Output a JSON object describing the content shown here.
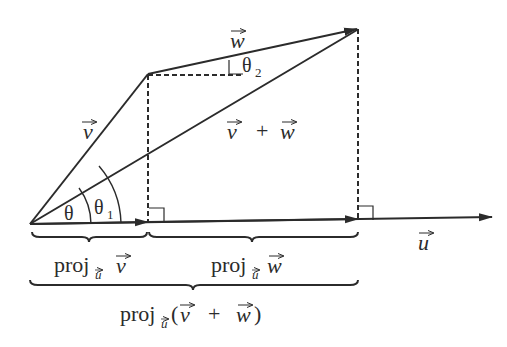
{
  "diagram": {
    "type": "vector-projection-diagram",
    "colors": {
      "stroke": "#2b2b2b",
      "background": "#ffffff"
    },
    "points": {
      "origin": [
        30,
        224
      ],
      "v_tip": [
        148,
        74
      ],
      "vw_tip": [
        357,
        29
      ],
      "v_foot": [
        148,
        222
      ],
      "vw_foot": [
        358,
        220
      ],
      "u_tip": [
        492,
        217
      ]
    },
    "vectors": [
      {
        "id": "v",
        "label": "v",
        "from": "origin",
        "to": "v_tip"
      },
      {
        "id": "w",
        "label": "w",
        "from": "v_tip",
        "to": "vw_tip"
      },
      {
        "id": "v_plus_w",
        "label_parts": [
          "v",
          "+",
          "w"
        ],
        "from": "origin",
        "to": "vw_tip"
      },
      {
        "id": "u",
        "label": "u",
        "from": "origin",
        "to": "u_tip"
      }
    ],
    "angles": {
      "theta": "θ",
      "theta1": {
        "base": "θ",
        "sub": "1"
      },
      "theta2": {
        "base": "θ",
        "sub": "2"
      }
    },
    "braces": [
      {
        "id": "proj_v",
        "label_prefix": "proj",
        "label_sub": "u",
        "label_vec": "v"
      },
      {
        "id": "proj_w",
        "label_prefix": "proj",
        "label_sub": "u",
        "label_vec": "w"
      },
      {
        "id": "proj_vw",
        "label_prefix": "proj",
        "label_sub": "u",
        "label_open": "(",
        "label_v": "v",
        "label_plus": "+",
        "label_w": "w",
        "label_close": ")"
      }
    ]
  }
}
